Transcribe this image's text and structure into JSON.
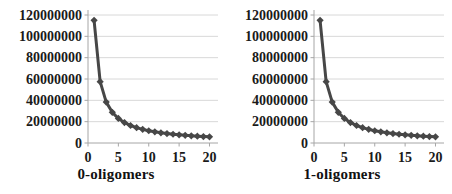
{
  "figure": {
    "background": "#ffffff"
  },
  "palette": {
    "series": "#474747",
    "grid": "#d8d8d8",
    "axis": "#a6a6a6",
    "text": "#1a1a1a"
  },
  "chart_data": [
    {
      "type": "line",
      "title": "",
      "xlabel": "0-oligomers",
      "ylabel": "",
      "marker": "diamond",
      "legend": "none",
      "grid": "horizontal",
      "x": [
        1,
        2,
        3,
        4,
        5,
        6,
        7,
        8,
        9,
        10,
        11,
        12,
        13,
        14,
        15,
        16,
        17,
        18,
        19,
        20
      ],
      "series": [
        {
          "name": "0-oligomers",
          "values": [
            115000000,
            57500000,
            38333000,
            28750000,
            23000000,
            19167000,
            16429000,
            14375000,
            12778000,
            11500000,
            10455000,
            9583000,
            8846000,
            8214000,
            7667000,
            7188000,
            6765000,
            6389000,
            6053000,
            5750000
          ]
        }
      ],
      "xlim": [
        0,
        21.4
      ],
      "ylim": [
        0,
        120000000
      ],
      "xticks": [
        0,
        5,
        10,
        15,
        20
      ],
      "yticks": [
        0,
        20000000,
        40000000,
        60000000,
        80000000,
        100000000,
        120000000
      ],
      "ytick_labels": [
        "0",
        "20000000",
        "40000000",
        "60000000",
        "80000000",
        "100000000",
        "120000000"
      ],
      "xtick_labels": [
        "0",
        "5",
        "10",
        "15",
        "20"
      ]
    },
    {
      "type": "line",
      "title": "",
      "xlabel": "1-oligomers",
      "ylabel": "",
      "marker": "diamond",
      "legend": "none",
      "grid": "horizontal",
      "x": [
        1,
        2,
        3,
        4,
        5,
        6,
        7,
        8,
        9,
        10,
        11,
        12,
        13,
        14,
        15,
        16,
        17,
        18,
        19,
        20
      ],
      "series": [
        {
          "name": "1-oligomers",
          "values": [
            115000000,
            57500000,
            38333000,
            28750000,
            23000000,
            19167000,
            16429000,
            14375000,
            12778000,
            11500000,
            10455000,
            9583000,
            8846000,
            8214000,
            7667000,
            7188000,
            6765000,
            6389000,
            6053000,
            5750000
          ]
        }
      ],
      "xlim": [
        0,
        21.4
      ],
      "ylim": [
        0,
        120000000
      ],
      "xticks": [
        0,
        5,
        10,
        15,
        20
      ],
      "yticks": [
        0,
        20000000,
        40000000,
        60000000,
        80000000,
        100000000,
        120000000
      ],
      "ytick_labels": [
        "0",
        "20000000",
        "40000000",
        "60000000",
        "80000000",
        "100000000",
        "120000000"
      ],
      "xtick_labels": [
        "0",
        "5",
        "10",
        "15",
        "20"
      ]
    }
  ]
}
